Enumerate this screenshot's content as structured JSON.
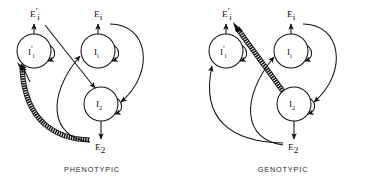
{
  "figure": {
    "background_color": "#ffffff",
    "ink_color": "#111111",
    "width": 367,
    "height": 184,
    "type": "causal-path-diagram",
    "panel_count": 2
  },
  "panels": [
    {
      "id": "phenotypic",
      "caption": "PHENOTYPIC",
      "caption_x": 92,
      "caption_y": 170,
      "nodes": [
        {
          "id": "Iprime_i",
          "base": "I",
          "prime": "'",
          "sub": "i",
          "cx": 34,
          "cy": 51,
          "r": 17
        },
        {
          "id": "I_i",
          "base": "I",
          "prime": "",
          "sub": "i",
          "cx": 98,
          "cy": 51,
          "r": 17
        },
        {
          "id": "I_2",
          "base": "I",
          "prime": "",
          "sub": "2",
          "cx": 101,
          "cy": 104,
          "r": 17
        }
      ],
      "external": [
        {
          "id": "Eprime_i",
          "base": "E",
          "prime": "'",
          "sub": "i",
          "x": 30,
          "y": 17
        },
        {
          "id": "E_i",
          "base": "E",
          "prime": "",
          "sub": "i",
          "x": 96,
          "y": 17
        },
        {
          "id": "E_2",
          "base": "E",
          "prime": "",
          "sub": "2",
          "x": 96,
          "y": 149
        }
      ]
    },
    {
      "id": "genotypic",
      "caption": "GENOTYPIC",
      "caption_x": 283,
      "caption_y": 170,
      "nodes": [
        {
          "id": "Iprime_i",
          "base": "I",
          "prime": "'",
          "sub": "i",
          "cx": 226,
          "cy": 51,
          "r": 17
        },
        {
          "id": "I_i",
          "base": "I",
          "prime": "",
          "sub": "i",
          "cx": 291,
          "cy": 51,
          "r": 17
        },
        {
          "id": "I_2",
          "base": "I",
          "prime": "",
          "sub": "2",
          "cx": 294,
          "cy": 104,
          "r": 17
        }
      ],
      "external": [
        {
          "id": "Eprime_i",
          "base": "E",
          "prime": "'",
          "sub": "i",
          "x": 222,
          "y": 17
        },
        {
          "id": "E_i",
          "base": "E",
          "prime": "",
          "sub": "i",
          "x": 289,
          "y": 17
        },
        {
          "id": "E_2",
          "base": "E",
          "prime": "",
          "sub": "2",
          "x": 289,
          "y": 149
        }
      ]
    }
  ],
  "legend_notes": {
    "thin_arrow": "single-line causal path",
    "thick_hatched_arrow": "emphasised / hatched causal path"
  }
}
